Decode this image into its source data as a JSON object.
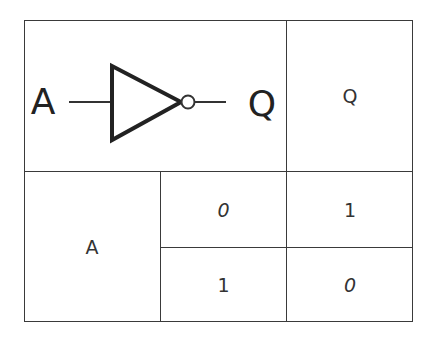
{
  "diagram": {
    "symbol": {
      "input_label": "A",
      "output_label": "Q",
      "gate": "not-gate-icon"
    },
    "table": {
      "output_header": "Q",
      "input_header": "A",
      "rows": [
        {
          "a": "0",
          "q": "1"
        },
        {
          "a": "1",
          "q": "0"
        }
      ]
    },
    "colors": {
      "line": "#3a3a3a",
      "text": "#333333",
      "background": "#ffffff"
    }
  }
}
